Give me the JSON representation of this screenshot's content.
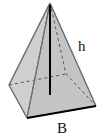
{
  "figure": {
    "type": "square pyramid",
    "labels": {
      "height": "h",
      "base": "B"
    },
    "colors": {
      "face_fill": "#c8c8c8",
      "front_face_fill": "#bdbdbd",
      "edge": "#6e6e6e",
      "height_line": "#000000",
      "base_edge": "#000000",
      "hidden_edge": "#555555"
    }
  }
}
